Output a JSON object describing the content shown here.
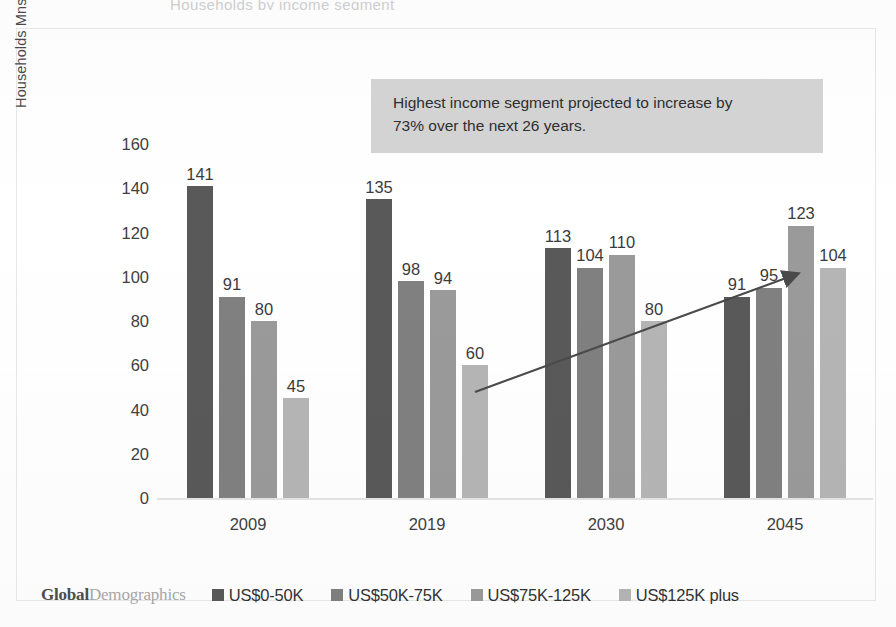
{
  "title_remnant": "Households by income segment",
  "y_axis": {
    "label": "Households Mns In income segment",
    "ticks": [
      "160",
      "140",
      "120",
      "100",
      "80",
      "60",
      "40",
      "20",
      "0"
    ]
  },
  "callout": {
    "line1": "Highest income segment projected to increase by",
    "line2": "73% over the next 26 years.",
    "background": "#d4d4d4"
  },
  "brand": {
    "primary": "Global",
    "secondary": "Demographics"
  },
  "legend": {
    "items": [
      {
        "label": "US$0-50K",
        "color": "#595959",
        "swatch": "legend-swatch-0-50k"
      },
      {
        "label": "US$50K-75K",
        "color": "#808080",
        "swatch": "legend-swatch-50-75k"
      },
      {
        "label": "US$75K-125K",
        "color": "#9a9a9a",
        "swatch": "legend-swatch-75-125k"
      },
      {
        "label": "US$125K plus",
        "color": "#b5b5b5",
        "swatch": "legend-swatch-125k-plus"
      }
    ]
  },
  "annotation_arrow": {
    "name": "trend-arrow",
    "from": [
      475,
      392
    ],
    "to": [
      801,
      272
    ],
    "color": "#4a4a4a"
  },
  "chart_data": {
    "type": "bar",
    "title": "Households by income segment",
    "xlabel": "",
    "ylabel": "Households Mns In income segment",
    "ylim": [
      0,
      160
    ],
    "ytick_step": 20,
    "grid": false,
    "legend_position": "bottom",
    "categories": [
      "2009",
      "2019",
      "2030",
      "2045"
    ],
    "series": [
      {
        "name": "US$0-50K",
        "color": "#595959",
        "values": [
          141,
          135,
          113,
          91
        ]
      },
      {
        "name": "US$50K-75K",
        "color": "#808080",
        "values": [
          91,
          98,
          104,
          95
        ]
      },
      {
        "name": "US$75K-125K",
        "color": "#9a9a9a",
        "values": [
          80,
          94,
          110,
          123
        ]
      },
      {
        "name": "US$125K plus",
        "color": "#b5b5b5",
        "values": [
          45,
          60,
          80,
          104
        ]
      }
    ],
    "annotations": [
      "Highest income segment projected to increase by 73% over the next 26 years."
    ]
  }
}
